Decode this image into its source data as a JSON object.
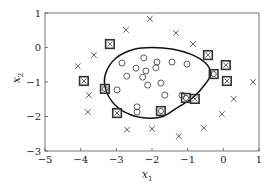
{
  "chart_data": {
    "type": "scatter",
    "title": "",
    "xlabel": "x",
    "xlabel_sub": "1",
    "ylabel": "x",
    "ylabel_sub": "2",
    "xlim": [
      -5,
      1
    ],
    "ylim": [
      -3,
      1
    ],
    "xticks": [
      -5,
      -4,
      -3,
      -2,
      -1,
      0,
      1
    ],
    "yticks": [
      -3,
      -2,
      -1,
      0,
      1
    ],
    "xtick_labels": [
      "−5",
      "−4",
      "−3",
      "−2",
      "−1",
      "0",
      "1"
    ],
    "ytick_labels": [
      "−3",
      "−2",
      "−1",
      "0",
      "1"
    ],
    "grid": false,
    "legend": "none",
    "series": [
      {
        "name": "class-negative",
        "marker": "x",
        "points": [
          [
            -2.06,
            0.83
          ],
          [
            -2.73,
            0.51
          ],
          [
            -1.33,
            0.42
          ],
          [
            -3.63,
            -0.22
          ],
          [
            -4.08,
            -0.54
          ],
          [
            -3.77,
            -1.38
          ],
          [
            -3.8,
            -1.87
          ],
          [
            -2.7,
            -2.38
          ],
          [
            -2.0,
            -2.36
          ],
          [
            -1.25,
            -2.57
          ],
          [
            -0.55,
            -2.33
          ],
          [
            -0.04,
            -1.93
          ],
          [
            0.29,
            -1.49
          ],
          [
            0.83,
            -1.0
          ],
          [
            -0.85,
            0.1
          ]
        ]
      },
      {
        "name": "class-positive",
        "marker": "o",
        "points": [
          [
            -2.84,
            -0.45
          ],
          [
            -2.23,
            -0.3
          ],
          [
            -1.86,
            -0.42
          ],
          [
            -1.44,
            -0.42
          ],
          [
            -2.45,
            -0.6
          ],
          [
            -2.17,
            -0.68
          ],
          [
            -1.89,
            -0.59
          ],
          [
            -2.71,
            -0.83
          ],
          [
            -2.26,
            -0.86
          ],
          [
            -2.12,
            -1.09
          ],
          [
            -1.75,
            -1.03
          ],
          [
            -2.98,
            -1.23
          ],
          [
            -1.64,
            -1.38
          ],
          [
            -1.02,
            -0.48
          ],
          [
            -1.16,
            -1.38
          ],
          [
            -2.42,
            -1.72
          ],
          [
            -2.42,
            -1.87
          ]
        ]
      },
      {
        "name": "support-vectors-negative",
        "marker": "boxed-x",
        "points": [
          [
            -3.18,
            0.1
          ],
          [
            -3.91,
            -0.97
          ],
          [
            -2.98,
            -1.9
          ],
          [
            -0.43,
            -0.22
          ],
          [
            0.07,
            -0.51
          ],
          [
            0.1,
            -0.97
          ],
          [
            -0.8,
            -1.49
          ]
        ]
      },
      {
        "name": "support-vectors-positive",
        "marker": "boxed-o",
        "points": [
          [
            -3.32,
            -1.2
          ],
          [
            -0.27,
            -0.77
          ],
          [
            -1.75,
            -1.84
          ],
          [
            -1.05,
            -1.46
          ]
        ]
      }
    ],
    "decision_boundary": {
      "closed": true,
      "points": [
        [
          -3.0,
          -0.3
        ],
        [
          -2.5,
          -0.05
        ],
        [
          -2.0,
          0.0
        ],
        [
          -1.4,
          -0.05
        ],
        [
          -0.9,
          -0.2
        ],
        [
          -0.5,
          -0.45
        ],
        [
          -0.35,
          -0.75
        ],
        [
          -0.5,
          -1.05
        ],
        [
          -0.85,
          -1.45
        ],
        [
          -1.3,
          -1.75
        ],
        [
          -1.7,
          -2.0
        ],
        [
          -2.1,
          -2.05
        ],
        [
          -2.6,
          -1.95
        ],
        [
          -3.05,
          -1.65
        ],
        [
          -3.3,
          -1.2
        ],
        [
          -3.3,
          -0.75
        ]
      ]
    }
  }
}
